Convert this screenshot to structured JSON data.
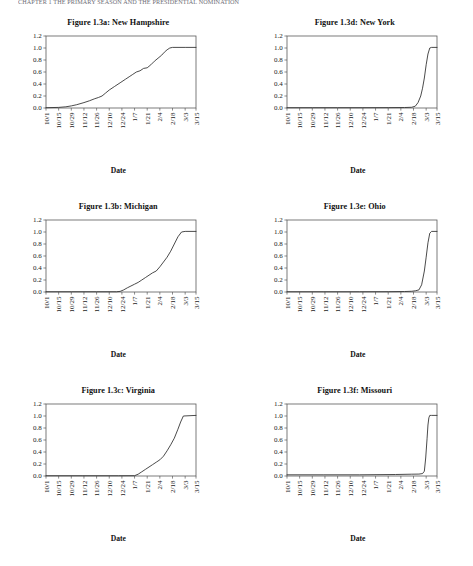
{
  "page": {
    "running_header": "CHAPTER 1  THE PRIMARY SEASON AND THE PRESIDENTIAL NOMINATION",
    "axis_title": "Date",
    "date_label": "Date"
  },
  "axes": {
    "y_ticks": [
      "0.0",
      "0.2",
      "0.4",
      "0.6",
      "0.8",
      "1.0",
      "1.2"
    ],
    "y_values": [
      0.0,
      0.2,
      0.4,
      0.6,
      0.8,
      1.0,
      1.2
    ],
    "ylim": [
      0.0,
      1.2
    ],
    "x_ticks": [
      "10/1",
      "10/15",
      "10/29",
      "11/12",
      "11/26",
      "12/10",
      "12/24",
      "1/7",
      "1/21",
      "2/4",
      "2/18",
      "3/3",
      "3/15"
    ],
    "x_tick_positions": [
      0,
      14,
      28,
      42,
      56,
      70,
      84,
      98,
      112,
      126,
      140,
      154,
      166
    ],
    "xlim": [
      0,
      166
    ],
    "grid": false,
    "legend": "none"
  },
  "chart_data": [
    {
      "id": "panel-a",
      "type": "line",
      "title": "Figure 1.3a: New Hampshire",
      "xlabel": "Date",
      "ylabel": "",
      "ylim": [
        0.0,
        1.2
      ],
      "xlim": [
        0,
        166
      ],
      "x_tick_labels": [
        "10/1",
        "10/15",
        "10/29",
        "11/12",
        "11/26",
        "12/10",
        "12/24",
        "1/7",
        "1/21",
        "2/4",
        "2/18",
        "3/3",
        "3/15"
      ],
      "y_tick_labels": [
        "0.0",
        "0.2",
        "0.4",
        "0.6",
        "0.8",
        "1.0",
        "1.2"
      ],
      "series": [
        {
          "name": "cumulative share",
          "x": [
            0,
            14,
            22,
            28,
            34,
            42,
            48,
            54,
            58,
            62,
            66,
            70,
            76,
            82,
            88,
            92,
            96,
            100,
            104,
            108,
            112,
            116,
            120,
            124,
            128,
            131,
            134,
            137,
            140,
            154,
            166
          ],
          "y": [
            0.005,
            0.01,
            0.02,
            0.035,
            0.055,
            0.09,
            0.12,
            0.155,
            0.175,
            0.2,
            0.25,
            0.3,
            0.36,
            0.42,
            0.48,
            0.52,
            0.56,
            0.6,
            0.62,
            0.66,
            0.67,
            0.72,
            0.78,
            0.83,
            0.88,
            0.93,
            0.97,
            1.0,
            1.01,
            1.01,
            1.01
          ]
        }
      ]
    },
    {
      "id": "panel-d",
      "type": "line",
      "title": "Figure 1.3d: New York",
      "xlabel": "Date",
      "ylabel": "",
      "ylim": [
        0.0,
        1.2
      ],
      "xlim": [
        0,
        166
      ],
      "x_tick_labels": [
        "10/1",
        "10/15",
        "10/29",
        "11/12",
        "11/26",
        "12/10",
        "12/24",
        "1/7",
        "1/21",
        "2/4",
        "2/18",
        "3/3",
        "3/15"
      ],
      "y_tick_labels": [
        "0.0",
        "0.2",
        "0.4",
        "0.6",
        "0.8",
        "1.0",
        "1.2"
      ],
      "series": [
        {
          "name": "cumulative share",
          "x": [
            0,
            28,
            56,
            84,
            112,
            130,
            138,
            142,
            145,
            148,
            150,
            152,
            154,
            156,
            158,
            160,
            166
          ],
          "y": [
            0.005,
            0.005,
            0.005,
            0.005,
            0.006,
            0.008,
            0.012,
            0.03,
            0.09,
            0.2,
            0.33,
            0.5,
            0.72,
            0.9,
            1.0,
            1.01,
            1.01
          ]
        }
      ]
    },
    {
      "id": "panel-b",
      "type": "line",
      "title": "Figure 1.3b: Michigan",
      "xlabel": "Date",
      "ylabel": "",
      "ylim": [
        0.0,
        1.2
      ],
      "xlim": [
        0,
        166
      ],
      "x_tick_labels": [
        "10/1",
        "10/15",
        "10/29",
        "11/12",
        "11/26",
        "12/10",
        "12/24",
        "1/7",
        "1/21",
        "2/4",
        "2/18",
        "3/3",
        "3/15"
      ],
      "y_tick_labels": [
        "0.0",
        "0.2",
        "0.4",
        "0.6",
        "0.8",
        "1.0",
        "1.2"
      ],
      "series": [
        {
          "name": "cumulative share",
          "x": [
            0,
            28,
            56,
            78,
            82,
            86,
            90,
            94,
            98,
            102,
            106,
            110,
            114,
            118,
            122,
            126,
            130,
            134,
            138,
            142,
            146,
            150,
            154,
            166
          ],
          "y": [
            0.004,
            0.004,
            0.004,
            0.004,
            0.01,
            0.035,
            0.07,
            0.1,
            0.13,
            0.16,
            0.2,
            0.24,
            0.28,
            0.32,
            0.35,
            0.42,
            0.5,
            0.58,
            0.68,
            0.8,
            0.92,
            1.0,
            1.01,
            1.01
          ]
        }
      ]
    },
    {
      "id": "panel-e",
      "type": "line",
      "title": "Figure 1.3e: Ohio",
      "xlabel": "Date",
      "ylabel": "",
      "ylim": [
        0.0,
        1.2
      ],
      "xlim": [
        0,
        166
      ],
      "x_tick_labels": [
        "10/1",
        "10/15",
        "10/29",
        "11/12",
        "11/26",
        "12/10",
        "12/24",
        "1/7",
        "1/21",
        "2/4",
        "2/18",
        "3/3",
        "3/15"
      ],
      "y_tick_labels": [
        "0.0",
        "0.2",
        "0.4",
        "0.6",
        "0.8",
        "1.0",
        "1.2"
      ],
      "series": [
        {
          "name": "cumulative share",
          "x": [
            0,
            40,
            80,
            112,
            130,
            138,
            142,
            146,
            149,
            152,
            154,
            156,
            158,
            160,
            166
          ],
          "y": [
            0.004,
            0.004,
            0.004,
            0.005,
            0.008,
            0.012,
            0.02,
            0.035,
            0.12,
            0.35,
            0.58,
            0.82,
            0.98,
            1.01,
            1.01
          ]
        }
      ]
    },
    {
      "id": "panel-c",
      "type": "line",
      "title": "Figure 1.3c: Virginia",
      "xlabel": "Date",
      "ylabel": "",
      "ylim": [
        0.0,
        1.2
      ],
      "xlim": [
        0,
        166
      ],
      "x_tick_labels": [
        "10/1",
        "10/15",
        "10/29",
        "11/12",
        "11/26",
        "12/10",
        "12/24",
        "1/7",
        "1/21",
        "2/4",
        "2/18",
        "3/3",
        "3/15"
      ],
      "y_tick_labels": [
        "0.0",
        "0.2",
        "0.4",
        "0.6",
        "0.8",
        "1.0",
        "1.2"
      ],
      "series": [
        {
          "name": "cumulative share",
          "x": [
            0,
            40,
            80,
            98,
            102,
            106,
            110,
            114,
            118,
            122,
            126,
            130,
            134,
            138,
            142,
            146,
            149,
            152,
            166
          ],
          "y": [
            0.004,
            0.004,
            0.004,
            0.005,
            0.03,
            0.07,
            0.11,
            0.15,
            0.19,
            0.23,
            0.27,
            0.33,
            0.42,
            0.52,
            0.63,
            0.78,
            0.9,
            1.0,
            1.01
          ]
        }
      ]
    },
    {
      "id": "panel-f",
      "type": "line",
      "title": "Figure 1.3f: Missouri",
      "xlabel": "Date",
      "ylabel": "",
      "ylim": [
        0.0,
        1.2
      ],
      "xlim": [
        0,
        166
      ],
      "x_tick_labels": [
        "10/1",
        "10/15",
        "10/29",
        "11/12",
        "11/26",
        "12/10",
        "12/24",
        "1/7",
        "1/21",
        "2/4",
        "2/18",
        "3/3",
        "3/15"
      ],
      "y_tick_labels": [
        "0.0",
        "0.2",
        "0.4",
        "0.6",
        "0.8",
        "1.0",
        "1.2"
      ],
      "series": [
        {
          "name": "cumulative share",
          "x": [
            0,
            40,
            80,
            120,
            138,
            146,
            150,
            152,
            153.5,
            155,
            156,
            157,
            158,
            160,
            166
          ],
          "y": [
            0.02,
            0.02,
            0.02,
            0.025,
            0.03,
            0.032,
            0.04,
            0.08,
            0.3,
            0.62,
            0.85,
            0.97,
            1.01,
            1.01,
            1.01
          ]
        }
      ]
    }
  ]
}
